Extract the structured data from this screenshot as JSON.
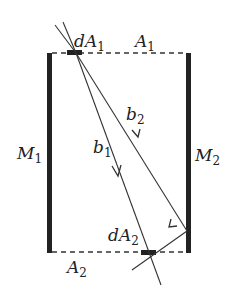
{
  "diagram": {
    "labels": {
      "dA1": {
        "main": "dA",
        "sub": "1"
      },
      "A1": {
        "main": "A",
        "sub": "1"
      },
      "M1": {
        "main": "M",
        "sub": "1"
      },
      "M2": {
        "main": "M",
        "sub": "2"
      },
      "b1": {
        "main": "b",
        "sub": "1"
      },
      "b2": {
        "main": "b",
        "sub": "2"
      },
      "dA2": {
        "main": "dA",
        "sub": "2"
      },
      "A2": {
        "main": "A",
        "sub": "2"
      }
    },
    "colors": {
      "stroke": "#333333",
      "mirror": "#222222"
    }
  }
}
